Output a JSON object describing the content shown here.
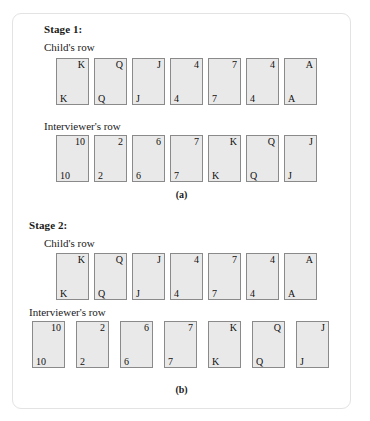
{
  "figure": {
    "panels": [
      {
        "id": "panel-a",
        "stage_title": "Stage 1:",
        "caption": "(a)",
        "rows": [
          {
            "id": "child-row",
            "label": "Child's row",
            "cards": [
              {
                "top": "K",
                "bottom": "K"
              },
              {
                "top": "Q",
                "bottom": "Q"
              },
              {
                "top": "J",
                "bottom": "J"
              },
              {
                "top": "4",
                "bottom": "4"
              },
              {
                "top": "7",
                "bottom": "7"
              },
              {
                "top": "4",
                "bottom": "4"
              },
              {
                "top": "A",
                "bottom": "A"
              }
            ]
          },
          {
            "id": "interviewer-row",
            "label": "Interviewer's row",
            "cards": [
              {
                "top": "10",
                "bottom": "10"
              },
              {
                "top": "2",
                "bottom": "2"
              },
              {
                "top": "6",
                "bottom": "6"
              },
              {
                "top": "7",
                "bottom": "7"
              },
              {
                "top": "K",
                "bottom": "K"
              },
              {
                "top": "Q",
                "bottom": "Q"
              },
              {
                "top": "J",
                "bottom": "J"
              }
            ]
          }
        ]
      },
      {
        "id": "panel-b",
        "stage_title": "Stage 2:",
        "caption": "(b)",
        "rows": [
          {
            "id": "child-row",
            "label": "Child's row",
            "cards": [
              {
                "top": "K",
                "bottom": "K"
              },
              {
                "top": "Q",
                "bottom": "Q"
              },
              {
                "top": "J",
                "bottom": "J"
              },
              {
                "top": "4",
                "bottom": "4"
              },
              {
                "top": "7",
                "bottom": "7"
              },
              {
                "top": "4",
                "bottom": "4"
              },
              {
                "top": "A",
                "bottom": "A"
              }
            ]
          },
          {
            "id": "interviewer-row",
            "label": "Interviewer's row",
            "cards": [
              {
                "top": "10",
                "bottom": "10"
              },
              {
                "top": "2",
                "bottom": "2"
              },
              {
                "top": "6",
                "bottom": "6"
              },
              {
                "top": "7",
                "bottom": "7"
              },
              {
                "top": "K",
                "bottom": "K"
              },
              {
                "top": "Q",
                "bottom": "Q"
              },
              {
                "top": "J",
                "bottom": "J"
              }
            ]
          }
        ]
      }
    ]
  },
  "layout": {
    "panel_a": {
      "stage_title_pos": {
        "left": 43,
        "top": 22
      },
      "child_label_pos": {
        "left": 43,
        "top": 40
      },
      "child_row_pos": {
        "left": 55,
        "top": 57,
        "gap": 5
      },
      "interviewer_label_pos": {
        "left": 43,
        "top": 119
      },
      "interviewer_row_pos": {
        "left": 55,
        "top": 134,
        "gap": 5
      },
      "caption_pos": {
        "top": 188
      }
    },
    "panel_b": {
      "stage_title_pos": {
        "left": 28,
        "top": 218
      },
      "child_label_pos": {
        "left": 43,
        "top": 236
      },
      "child_row_pos": {
        "left": 55,
        "top": 252,
        "gap": 5
      },
      "interviewer_label_pos": {
        "left": 28,
        "top": 305
      },
      "interviewer_row_pos": {
        "left": 31,
        "top": 320,
        "gap": 11
      },
      "caption_pos": {
        "top": 383
      }
    }
  },
  "colors": {
    "card_face": "#e9e9e9",
    "card_border": "#8a8a8a",
    "frame_border": "#e3e3e3",
    "text": "#1a1a1a",
    "background": "#ffffff"
  }
}
